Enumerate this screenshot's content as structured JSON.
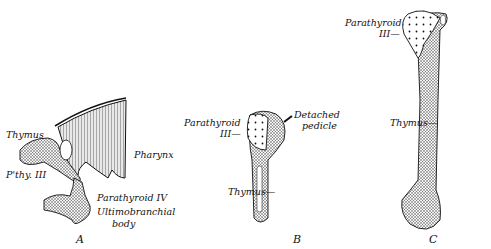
{
  "figure": {
    "panels": [
      {
        "id": "A",
        "caption": "A",
        "labels": {
          "thymus": "Thymus",
          "pthy": "P'thy. III",
          "pharynx": "Pharynx",
          "parathyroid_iv": "Parathyroid IV",
          "ultimobranchial_1": "Ultimobranchial",
          "ultimobranchial_2": "body"
        }
      },
      {
        "id": "B",
        "caption": "B",
        "labels": {
          "parathyroid_1": "Parathyroid",
          "parathyroid_2": "III—",
          "detached_1": "Detached",
          "detached_2": "pedicle",
          "thymus": "Thymus—"
        }
      },
      {
        "id": "C",
        "caption": "C",
        "labels": {
          "parathyroid_1": "Parathyroid",
          "parathyroid_2": "III—",
          "thymus": "Thymus—"
        }
      }
    ]
  }
}
